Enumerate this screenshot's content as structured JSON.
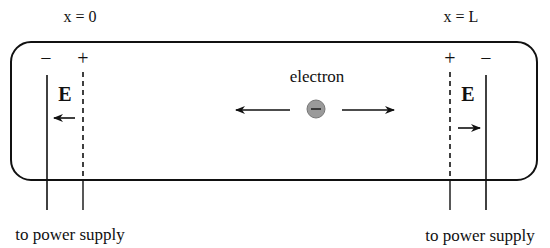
{
  "labels": {
    "left_position": "x = 0",
    "right_position": "x = L",
    "particle": "electron",
    "left_field": "E",
    "right_field": "E",
    "left_supply": "to power supply",
    "right_supply": "to power supply"
  },
  "signs": {
    "left_outer": "−",
    "left_inner": "+",
    "right_inner": "+",
    "right_outer": "−",
    "electron_charge": "−"
  },
  "colors": {
    "line": "#111111",
    "electron_fill": "#9a9a9a",
    "background": "#ffffff"
  }
}
